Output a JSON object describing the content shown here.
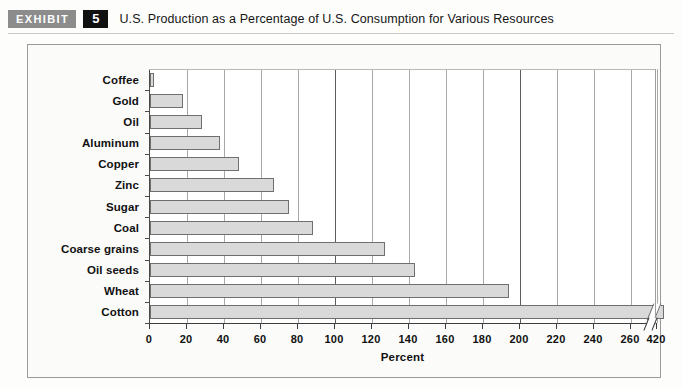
{
  "header": {
    "exhibit_tag": "EXHIBIT",
    "exhibit_number": "5",
    "title": "U.S. Production as a Percentage of U.S. Consumption for Various Resources"
  },
  "colors": {
    "bar_fill": "#d9d9d9",
    "bar_stroke": "#6f6f6f",
    "exhibit_tag_bg": "#8c8c8c",
    "exhibit_num_bg": "#111111",
    "panel_bg": "#fbfbfa",
    "panel_border": "#9a9a9a",
    "axis": "#3d3d3d",
    "gridline": "#a8a8a8"
  },
  "chart_data": {
    "type": "bar",
    "orientation": "horizontal",
    "title": "U.S. Production as a Percentage of U.S. Consumption for Various Resources",
    "xlabel": "Percent",
    "ylabel": "",
    "categories": [
      "Coffee",
      "Gold",
      "Oil",
      "Aluminum",
      "Copper",
      "Zinc",
      "Sugar",
      "Coal",
      "Coarse grains",
      "Oil seeds",
      "Wheat",
      "Cotton"
    ],
    "values": [
      2,
      18,
      28,
      38,
      48,
      67,
      75,
      88,
      127,
      143,
      194,
      420
    ],
    "xticks": [
      0,
      20,
      40,
      60,
      80,
      100,
      120,
      140,
      160,
      180,
      200,
      220,
      240,
      260,
      420
    ],
    "xtick_labels": [
      "0",
      "20",
      "40",
      "60",
      "80",
      "100",
      "120",
      "140",
      "160",
      "180",
      "200",
      "220",
      "240",
      "260",
      "420"
    ],
    "xlim": [
      0,
      280
    ],
    "axis_break": {
      "present": true,
      "after_value": 260,
      "resumes_at": 420,
      "note": "Cotton bar is truncated with a break mark before the 420 tick"
    },
    "major_gridlines_at": [
      100,
      200
    ],
    "grid": true,
    "legend": false
  }
}
